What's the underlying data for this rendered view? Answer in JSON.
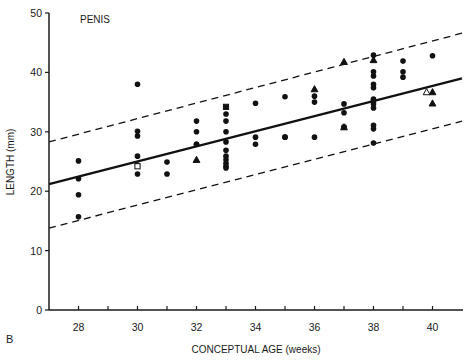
{
  "chart_data": {
    "type": "scatter",
    "title": "PENIS",
    "panel_label": "B",
    "xlabel": "CONCEPTUAL AGE (weeks)",
    "ylabel": "LENGTH (mm)",
    "xlim": [
      27,
      41
    ],
    "ylim": [
      0,
      50
    ],
    "xticks": [
      28,
      29,
      30,
      31,
      32,
      33,
      34,
      35,
      36,
      37,
      38,
      39,
      40
    ],
    "xtick_labels": [
      "28",
      "",
      "30",
      "",
      "32",
      "",
      "34",
      "",
      "36",
      "",
      "38",
      "",
      "40"
    ],
    "yticks": [
      0,
      10,
      20,
      30,
      40,
      50
    ],
    "ytick_labels": [
      "0",
      "10",
      "20",
      "30",
      "40",
      "50"
    ],
    "grid": false,
    "legend": null,
    "series": [
      {
        "name": "circle",
        "marker": "filled-circle",
        "points": [
          [
            28,
            25.1
          ],
          [
            28,
            22.1
          ],
          [
            28,
            19.4
          ],
          [
            28,
            15.7
          ],
          [
            30,
            38.0
          ],
          [
            30,
            30.1
          ],
          [
            30,
            29.3
          ],
          [
            30,
            25.9
          ],
          [
            30,
            24.4
          ],
          [
            30,
            22.9
          ],
          [
            31,
            24.9
          ],
          [
            31,
            22.9
          ],
          [
            32,
            31.8
          ],
          [
            32,
            30.0
          ],
          [
            32,
            27.9
          ],
          [
            32,
            27.9
          ],
          [
            33,
            33.0
          ],
          [
            33,
            31.8
          ],
          [
            33,
            30.0
          ],
          [
            33,
            28.3
          ],
          [
            33,
            26.9
          ],
          [
            33,
            25.9
          ],
          [
            33,
            25.3
          ],
          [
            33,
            24.7
          ],
          [
            33,
            24.2
          ],
          [
            33,
            23.9
          ],
          [
            34,
            34.8
          ],
          [
            34,
            29.1
          ],
          [
            34,
            27.9
          ],
          [
            35,
            35.9
          ],
          [
            35,
            29.1
          ],
          [
            35,
            29.1
          ],
          [
            36,
            36.0
          ],
          [
            36,
            35.0
          ],
          [
            36,
            29.1
          ],
          [
            37,
            34.7
          ],
          [
            37,
            33.2
          ],
          [
            37,
            30.8
          ],
          [
            37,
            30.8
          ],
          [
            38,
            42.9
          ],
          [
            38,
            40.1
          ],
          [
            38,
            39.4
          ],
          [
            38,
            38.0
          ],
          [
            38,
            37.4
          ],
          [
            38,
            35.5
          ],
          [
            38,
            35.2
          ],
          [
            38,
            34.7
          ],
          [
            38,
            34.0
          ],
          [
            38,
            31.1
          ],
          [
            38,
            30.5
          ],
          [
            38,
            28.1
          ],
          [
            39,
            41.9
          ],
          [
            39,
            40.1
          ],
          [
            39,
            39.2
          ],
          [
            40,
            42.8
          ]
        ]
      },
      {
        "name": "triangle",
        "marker": "filled-triangle",
        "points": [
          [
            32,
            25.3
          ],
          [
            36,
            37.2
          ],
          [
            37,
            41.8
          ],
          [
            37,
            30.8
          ],
          [
            38,
            42.1
          ],
          [
            40,
            36.7
          ],
          [
            40,
            34.8
          ]
        ]
      },
      {
        "name": "open-triangle",
        "marker": "open-triangle",
        "points": [
          [
            39.8,
            36.7
          ]
        ]
      },
      {
        "name": "square",
        "marker": "filled-square",
        "points": [
          [
            33,
            34.2
          ]
        ]
      },
      {
        "name": "open-square",
        "marker": "open-square",
        "points": [
          [
            30,
            24.2
          ]
        ]
      }
    ],
    "lines": [
      {
        "name": "regression",
        "style": "solid",
        "from": [
          27,
          21.2
        ],
        "to": [
          41,
          39.0
        ]
      },
      {
        "name": "upper-bound",
        "style": "dashed",
        "from": [
          27,
          28.3
        ],
        "to": [
          41,
          46.6
        ]
      },
      {
        "name": "lower-bound",
        "style": "dashed",
        "from": [
          27,
          13.8
        ],
        "to": [
          41,
          31.8
        ]
      }
    ]
  }
}
